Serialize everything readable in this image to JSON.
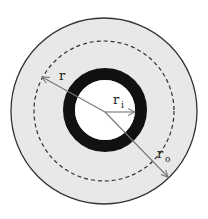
{
  "diagram": {
    "center": {
      "x": 104,
      "y": 111
    },
    "outer_disk": {
      "radius": 93,
      "fill": "#e8e8e8",
      "stroke": "#333333"
    },
    "dashed_circle": {
      "radius": 70,
      "stroke": "#333333"
    },
    "ring": {
      "outer_radius": 42,
      "inner_radius": 30,
      "fill": "#111111",
      "hole_fill": "#ffffff"
    },
    "arrow_color": "#777777",
    "labels": {
      "r": {
        "main": "r",
        "sub": ""
      },
      "r_i": {
        "main": "r",
        "sub": "i"
      },
      "r_o": {
        "main": "r",
        "sub": "o"
      }
    },
    "arrows": [
      {
        "name": "r",
        "from": [
          104,
          111
        ],
        "to": [
          42,
          77
        ]
      },
      {
        "name": "r_i",
        "from": [
          104,
          111
        ],
        "to": [
          135,
          111
        ]
      },
      {
        "name": "r_o",
        "from": [
          104,
          111
        ],
        "to": [
          168,
          177
        ]
      }
    ]
  }
}
